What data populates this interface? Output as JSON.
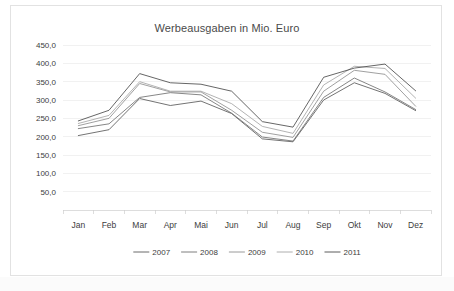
{
  "chart_data": {
    "type": "line",
    "title": "Werbeausgaben in Mio. Euro",
    "xlabel": "",
    "ylabel": "",
    "categories": [
      "Jan",
      "Feb",
      "Mar",
      "Apr",
      "Mai",
      "Jun",
      "Jul",
      "Aug",
      "Sep",
      "Okt",
      "Nov",
      "Dez"
    ],
    "ylim": [
      0,
      450
    ],
    "ytick_labels": [
      "450,0",
      "400,0",
      "350,0",
      "300,0",
      "250,0",
      "200,0",
      "150,0",
      "100,0",
      "50,0"
    ],
    "ytick_values": [
      450,
      400,
      350,
      300,
      250,
      200,
      150,
      100,
      50
    ],
    "grid": true,
    "legend_position": "bottom",
    "series": [
      {
        "name": "2007",
        "color": "#5a5a5a",
        "values": [
          203.0,
          219.0,
          304.0,
          285.0,
          297.0,
          263.0,
          194.0,
          186.0,
          300.0,
          347.0,
          318.0,
          271.0
        ]
      },
      {
        "name": "2008",
        "color": "#707070",
        "values": [
          222.0,
          235.0,
          307.0,
          320.0,
          314.0,
          264.0,
          199.0,
          188.0,
          307.0,
          360.0,
          322.0,
          274.0
        ]
      },
      {
        "name": "2009",
        "color": "#8f8f8f",
        "values": [
          230.0,
          250.0,
          345.0,
          322.0,
          322.0,
          272.0,
          212.0,
          198.0,
          324.0,
          381.0,
          370.0,
          283.0
        ]
      },
      {
        "name": "2010",
        "color": "#a5a5a5",
        "values": [
          236.0,
          258.0,
          350.0,
          324.0,
          324.0,
          290.0,
          228.0,
          209.0,
          341.0,
          392.0,
          386.0,
          305.0
        ]
      },
      {
        "name": "2011",
        "color": "#4a4a4a",
        "values": [
          243.0,
          272.0,
          372.0,
          347.0,
          343.0,
          324.0,
          241.0,
          226.0,
          362.0,
          387.0,
          398.0,
          325.0
        ]
      }
    ]
  }
}
